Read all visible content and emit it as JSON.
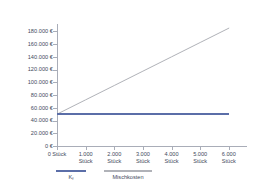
{
  "chart_data": {
    "type": "line",
    "title": "",
    "subtitle": "",
    "xlabel": "",
    "ylabel": "",
    "grid": false,
    "legend_position": "bottom-left",
    "x": [
      0,
      1000,
      2000,
      3000,
      4000,
      5000,
      6000
    ],
    "xlim": [
      0,
      6600
    ],
    "ylim": [
      0,
      190000
    ],
    "x_tick_values": [
      0,
      1000,
      2000,
      3000,
      4000,
      5000,
      6000
    ],
    "x_tick_labels": [
      {
        "line1": "0 Stück",
        "line2": ""
      },
      {
        "line1": "1.000",
        "line2": "Stück"
      },
      {
        "line1": "2.000",
        "line2": "Stück"
      },
      {
        "line1": "3.000",
        "line2": "Stück"
      },
      {
        "line1": "4.000",
        "line2": "Stück"
      },
      {
        "line1": "5.000",
        "line2": "Stück"
      },
      {
        "line1": "6.000",
        "line2": "Stück"
      }
    ],
    "y_tick_values": [
      0,
      20000,
      40000,
      60000,
      80000,
      100000,
      120000,
      140000,
      160000,
      180000
    ],
    "y_tick_labels": [
      "0 €",
      "20.000 €",
      "40.000 €",
      "60.000 €",
      "80.000 €",
      "100.000 €",
      "120.000 €",
      "140.000 €",
      "160.000 €",
      "180.000 €"
    ],
    "series": [
      {
        "name": "Kf",
        "name_base": "K",
        "name_sub": "f",
        "color": "#5b6ea8",
        "style": "solid",
        "values": [
          50000,
          50000,
          50000,
          50000,
          50000,
          50000,
          50000
        ]
      },
      {
        "name": "Mischkosten",
        "name_base": "Mischkosten",
        "name_sub": "",
        "color": "#b0b2b8",
        "style": "solid",
        "values": [
          50000,
          72500,
          95000,
          117500,
          140000,
          162500,
          185000
        ]
      }
    ]
  },
  "colors": {
    "background": "#ffffff",
    "axis": "#a9adb8",
    "text": "#434a5c",
    "series_fixed": "#5b6ea8",
    "series_mixed": "#b0b2b8"
  }
}
